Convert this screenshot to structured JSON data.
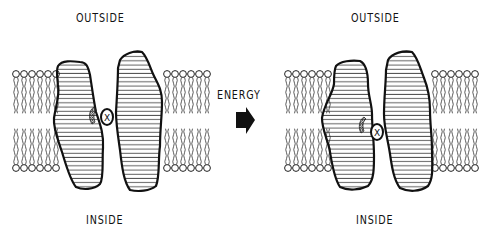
{
  "diagram": {
    "type": "membrane-transport-schematic",
    "panels": [
      {
        "id": "before",
        "top_label": "OUTSIDE",
        "bottom_label": "INSIDE",
        "substrate_symbol": "X",
        "substrate_position": "binding site open to outside"
      },
      {
        "id": "after",
        "top_label": "OUTSIDE",
        "bottom_label": "INSIDE",
        "substrate_symbol": "X",
        "substrate_position": "binding site moved toward inside"
      }
    ],
    "transition": {
      "label": "ENERGY",
      "arrow": "right-arrow"
    },
    "colors": {
      "ink": "#111111",
      "background": "#ffffff"
    }
  }
}
